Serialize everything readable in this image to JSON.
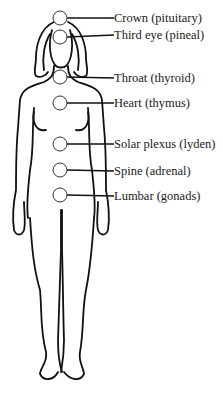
{
  "diagram": {
    "type": "anatomical-chakra-chart",
    "colors": {
      "line": "#111111",
      "circle_fill": "#ffffff",
      "text": "#1a1a1a",
      "background": "#ffffff"
    },
    "points": [
      {
        "id": "crown",
        "label": "Crown (pituitary)",
        "cx": 60,
        "cy": 18
      },
      {
        "id": "third-eye",
        "label": "Third eye (pineal)",
        "cx": 60,
        "cy": 37
      },
      {
        "id": "throat",
        "label": "Throat (thyroid)",
        "cx": 60,
        "cy": 77
      },
      {
        "id": "heart",
        "label": "Heart (thymus)",
        "cx": 60,
        "cy": 103
      },
      {
        "id": "solar-plexus",
        "label": "Solar plexus (lyden)",
        "cx": 60,
        "cy": 144
      },
      {
        "id": "spine",
        "label": "Spine (adrenal)",
        "cx": 60,
        "cy": 170
      },
      {
        "id": "lumbar",
        "label": "Lumbar (gonads)",
        "cx": 60,
        "cy": 195
      }
    ]
  }
}
